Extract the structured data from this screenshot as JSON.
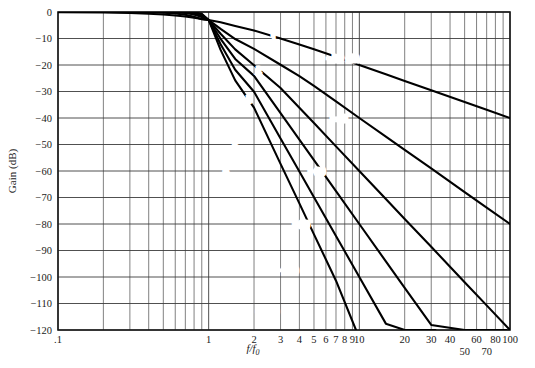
{
  "chart_data": {
    "type": "line",
    "title": "",
    "subtitle": "",
    "xlabel": "f/f0",
    "xlabel_display": "f/f₀",
    "ylabel": "Gain (dB)",
    "xscale": "log",
    "yscale": "linear",
    "xlim": [
      0.1,
      100
    ],
    "ylim": [
      -120,
      0
    ],
    "grid": true,
    "legend_position": "inline-curve-labels",
    "x_tick_labels": [
      {
        "value": 0.1,
        "label": ".1",
        "row": 0
      },
      {
        "value": 1,
        "label": "1",
        "row": 0
      },
      {
        "value": 2,
        "label": "2",
        "row": 0
      },
      {
        "value": 3,
        "label": "3",
        "row": 0
      },
      {
        "value": 4,
        "label": "4",
        "row": 0
      },
      {
        "value": 5,
        "label": "5",
        "row": 0
      },
      {
        "value": 6,
        "label": "6",
        "row": 0
      },
      {
        "value": 7,
        "label": "7",
        "row": 0
      },
      {
        "value": 8,
        "label": "8",
        "row": 0
      },
      {
        "value": 9,
        "label": "9",
        "row": 0
      },
      {
        "value": 10,
        "label": "10",
        "row": 0
      },
      {
        "value": 20,
        "label": "20",
        "row": 0
      },
      {
        "value": 30,
        "label": "30",
        "row": 0
      },
      {
        "value": 40,
        "label": "40",
        "row": 0
      },
      {
        "value": 50,
        "label": "50",
        "row": 1
      },
      {
        "value": 60,
        "label": "60",
        "row": 0
      },
      {
        "value": 70,
        "label": "70",
        "row": 1
      },
      {
        "value": 80,
        "label": "80",
        "row": 0
      },
      {
        "value": 100,
        "label": "100",
        "row": 0
      }
    ],
    "y_tick_labels": [
      {
        "value": 0,
        "label": "0"
      },
      {
        "value": -10,
        "label": "−10"
      },
      {
        "value": -20,
        "label": "−20"
      },
      {
        "value": -30,
        "label": "−30"
      },
      {
        "value": -40,
        "label": "−40"
      },
      {
        "value": -50,
        "label": "−50"
      },
      {
        "value": -60,
        "label": "−60"
      },
      {
        "value": -70,
        "label": "−70"
      },
      {
        "value": -80,
        "label": "−80"
      },
      {
        "value": -90,
        "label": "−90"
      },
      {
        "value": -100,
        "label": "−100"
      },
      {
        "value": -110,
        "label": "−110"
      },
      {
        "value": -120,
        "label": "−120"
      }
    ],
    "series": [
      {
        "name": "1",
        "order": 1,
        "label": "1",
        "slope_db_per_decade": -20,
        "points_x": [
          0.1,
          0.2,
          0.3,
          0.4,
          0.5,
          0.6,
          0.7,
          0.8,
          0.9,
          1.0,
          1.2,
          1.5,
          2.0,
          3.0,
          4.0,
          5.0,
          7.0,
          10.0,
          15.0,
          20.0,
          30.0,
          50.0,
          70.0,
          100.0
        ],
        "points_y": [
          -0.04,
          -0.17,
          -0.39,
          -0.64,
          -0.97,
          -1.34,
          -1.73,
          -2.15,
          -2.58,
          -3.01,
          -3.88,
          -5.3,
          -6.99,
          -10.0,
          -12.3,
          -14.1,
          -16.9,
          -20.0,
          -23.5,
          -26.0,
          -29.5,
          -34.0,
          -36.9,
          -40.0
        ],
        "endpoint_value_db": -40
      },
      {
        "name": "2",
        "order": 2,
        "label": "2",
        "slope_db_per_decade": -40,
        "points_x": [
          0.1,
          0.2,
          0.3,
          0.4,
          0.5,
          0.6,
          0.7,
          0.8,
          0.9,
          1.0,
          1.2,
          1.5,
          2.0,
          3.0,
          4.0,
          5.0,
          7.0,
          10.0,
          15.0,
          20.0,
          30.0,
          50.0,
          70.0,
          100.0
        ],
        "points_y": [
          0.0,
          0.0,
          -0.04,
          -0.11,
          -0.27,
          -0.56,
          -1.05,
          -1.77,
          -2.72,
          -3.01,
          -6.4,
          -10.2,
          -13.9,
          -19.9,
          -24.2,
          -27.9,
          -33.7,
          -40.0,
          -47.0,
          -52.0,
          -59.0,
          -68.0,
          -73.8,
          -80.0
        ],
        "endpoint_value_db": -80
      },
      {
        "name": "3",
        "order": 3,
        "label": "3",
        "slope_db_per_decade": -60,
        "points_x": [
          0.1,
          0.3,
          0.5,
          0.6,
          0.7,
          0.8,
          0.9,
          1.0,
          1.2,
          1.5,
          2.0,
          3.0,
          4.0,
          5.0,
          7.0,
          10.0,
          15.0,
          20.0,
          30.0,
          50.0,
          70.0,
          100.0
        ],
        "points_y": [
          0.0,
          0.0,
          -0.03,
          -0.1,
          -0.35,
          -0.92,
          -1.86,
          -3.01,
          -8.2,
          -14.1,
          -20.1,
          -28.7,
          -36.1,
          -41.9,
          -50.7,
          -60.0,
          -70.6,
          -78.1,
          -88.6,
          -102.0,
          -110.7,
          -120.0
        ],
        "endpoint_value_db": -120
      },
      {
        "name": "4",
        "order": 4,
        "label": "4",
        "slope_db_per_decade": -80,
        "points_x": [
          0.1,
          0.4,
          0.6,
          0.7,
          0.8,
          0.9,
          1.0,
          1.2,
          1.5,
          2.0,
          3.0,
          4.0,
          5.0,
          7.0,
          10.0,
          15.0,
          20.0,
          30.0,
          50.0,
          70.0,
          95.0
        ],
        "points_y": [
          0.0,
          0.0,
          -0.02,
          -0.11,
          -0.46,
          -1.35,
          -3.01,
          -10.1,
          -17.7,
          -24.1,
          -38.2,
          -48.2,
          -55.9,
          -67.6,
          -80.0,
          -94.1,
          -104.1,
          -118.1,
          -120.0,
          -120.0,
          -120.0
        ],
        "exit_x": 95.0,
        "exit_value_db": -120
      },
      {
        "name": "5",
        "order": 5,
        "label": "5",
        "slope_db_per_decade": -100,
        "points_x": [
          0.1,
          0.5,
          0.7,
          0.8,
          0.9,
          1.0,
          1.2,
          1.5,
          2.0,
          3.0,
          4.0,
          5.0,
          7.0,
          10.0,
          15.0,
          20.0,
          30.0,
          32.0
        ],
        "points_y": [
          0.0,
          0.0,
          -0.04,
          -0.23,
          -0.96,
          -3.01,
          -12.2,
          -21.8,
          -30.1,
          -47.7,
          -60.2,
          -69.9,
          -84.5,
          -100.0,
          -117.6,
          -120.0,
          -120.0,
          -120.0
        ],
        "exit_x": 32.0,
        "exit_value_db": -120
      },
      {
        "name": "6",
        "order": 6,
        "label": "6",
        "slope_db_per_decade": -120,
        "points_x": [
          0.1,
          0.6,
          0.8,
          0.9,
          1.0,
          1.2,
          1.5,
          2.0,
          3.0,
          4.0,
          5.0,
          7.0,
          9.5
        ],
        "points_y": [
          0.0,
          0.0,
          -0.11,
          -0.67,
          -3.01,
          -14.3,
          -25.8,
          -36.1,
          -57.3,
          -72.2,
          -83.9,
          -101.4,
          -120.0
        ],
        "exit_x": 9.5,
        "exit_value_db": -120
      }
    ],
    "annotations": [
      {
        "text": "−20 dB/decade",
        "x": 10.0,
        "y": -17.5,
        "for_series": "1"
      },
      {
        "text": "−40",
        "x": 7.3,
        "y": -40.0,
        "for_series": "2"
      },
      {
        "text": "−60",
        "x": 5.2,
        "y": -60.0,
        "for_series": "3"
      },
      {
        "text": "−80",
        "x": 4.1,
        "y": -80.0,
        "for_series": "4"
      },
      {
        "text": "−100",
        "x": 3.3,
        "y": -97.5,
        "for_series": "5"
      },
      {
        "text": "−120",
        "x": 2.45,
        "y": -113.0,
        "for_series": "6"
      }
    ],
    "curve_label_positions": [
      {
        "label": "1",
        "x": 2.7,
        "y": -9.5
      },
      {
        "label": "2",
        "x": 2.15,
        "y": -22.0
      },
      {
        "label": "3",
        "x": 1.85,
        "y": -33.0
      },
      {
        "label": "4",
        "x": 1.63,
        "y": -42.5
      },
      {
        "label": "5",
        "x": 1.5,
        "y": -50.5
      },
      {
        "label": "6",
        "x": 1.3,
        "y": -60.0
      }
    ],
    "colors": {
      "curve": "#000000",
      "gridline": "#3c3c3c",
      "background": "#ffffff",
      "text": "#1a1a1a"
    }
  }
}
